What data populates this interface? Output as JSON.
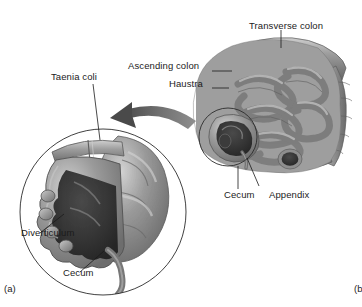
{
  "figure": {
    "background": "#ffffff",
    "ink": "#1b1b1b",
    "tissue": {
      "wall_mid": "#8a8a8a",
      "wall_light": "#c8c8c8",
      "wall_dark": "#6a6a6a",
      "lumen_dark": "#3a3a3a",
      "lumen_deep": "#2b2b2b",
      "outline": "#4a4a4a"
    }
  },
  "labels": {
    "transverse_colon": "Transverse colon",
    "ascending_colon": "Ascending colon",
    "haustra": "Haustra",
    "cecum_overview": "Cecum",
    "appendix": "Appendix",
    "taenia_coli": "Taenia coli",
    "diverticulum": "Diverticulum",
    "cecum_inset": "Cecum"
  },
  "panel_markers": {
    "left": "(a)",
    "right": "(b"
  }
}
